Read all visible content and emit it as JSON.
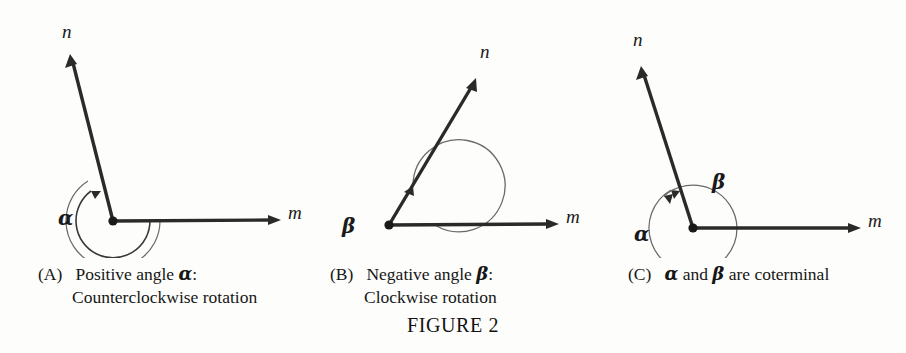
{
  "figure": {
    "title": "FIGURE 2",
    "background_color": "#fdfdfb",
    "ink_color": "#1a1a1a",
    "arc_color": "#5a5a5a"
  },
  "panels": [
    {
      "id": "A",
      "tag": "(A)",
      "caption_line1_pre": "Positive angle ",
      "caption_line1_greek": "α",
      "caption_line1_post": ":",
      "caption_line2": "Counterclockwise rotation",
      "ray_initial_label": "m",
      "ray_terminal_label": "n",
      "angle_labels": [
        {
          "symbol": "α",
          "x": 60,
          "y": 212
        }
      ],
      "rotation_direction": "counterclockwise",
      "vertex": {
        "x": 113,
        "y": 221
      },
      "ray_m_tip": {
        "x": 281,
        "y": 220
      },
      "ray_n_tip": {
        "x": 70,
        "y": 54
      },
      "ray_m_label_pos": {
        "x": 288,
        "y": 208
      },
      "ray_n_label_pos": {
        "x": 62,
        "y": 28
      }
    },
    {
      "id": "B",
      "tag": "(B)",
      "caption_line1_pre": "Negative angle ",
      "caption_line1_greek": "β",
      "caption_line1_post": ":",
      "caption_line2": "Clockwise rotation",
      "ray_initial_label": "m",
      "ray_terminal_label": "n",
      "angle_labels": [
        {
          "symbol": "β",
          "x": 46,
          "y": 219
        }
      ],
      "rotation_direction": "clockwise",
      "vertex": {
        "x": 89,
        "y": 225
      },
      "ray_m_tip": {
        "x": 259,
        "y": 224
      },
      "ray_n_tip": {
        "x": 176,
        "y": 78
      },
      "ray_m_label_pos": {
        "x": 266,
        "y": 212
      },
      "ray_n_label_pos": {
        "x": 180,
        "y": 48
      }
    },
    {
      "id": "C",
      "tag": "(C)",
      "caption_line1_pre": "",
      "caption_line1_greek": "α",
      "caption_line1_mid": " and ",
      "caption_line1_greek2": "β",
      "caption_line1_post": " are coterminal",
      "caption_line2": "",
      "ray_initial_label": "m",
      "ray_terminal_label": "n",
      "angle_labels": [
        {
          "symbol": "α",
          "x": 38,
          "y": 228
        },
        {
          "symbol": "β",
          "x": 116,
          "y": 178
        }
      ],
      "rotation_direction": "both",
      "vertex": {
        "x": 93,
        "y": 228
      },
      "ray_m_tip": {
        "x": 261,
        "y": 228
      },
      "ray_n_tip": {
        "x": 41,
        "y": 66
      },
      "ray_m_label_pos": {
        "x": 268,
        "y": 216
      },
      "ray_n_label_pos": {
        "x": 33,
        "y": 36
      }
    }
  ]
}
